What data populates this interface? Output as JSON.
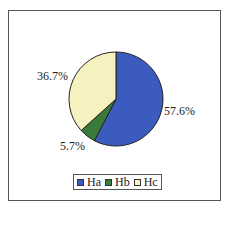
{
  "chart_data": {
    "type": "pie",
    "title": "",
    "categories": [
      "Ha",
      "Hb",
      "Hc"
    ],
    "values": [
      57.6,
      5.7,
      36.7
    ],
    "unit": "%",
    "colors": [
      "#3b5bbf",
      "#3a7a3a",
      "#f5f2c0"
    ],
    "data_labels": [
      "57.6%",
      "5.7%",
      "36.7%"
    ],
    "start_angle_deg": 0,
    "direction": "clockwise",
    "legend_position": "bottom"
  },
  "labels": {
    "ha": "57.6%",
    "hb": "5.7%",
    "hc": "36.7%"
  },
  "legend": [
    {
      "label": "Ha",
      "color": "#3b5bbf"
    },
    {
      "label": "Hb",
      "color": "#3a7a3a"
    },
    {
      "label": "Hc",
      "color": "#f5f2c0"
    }
  ]
}
